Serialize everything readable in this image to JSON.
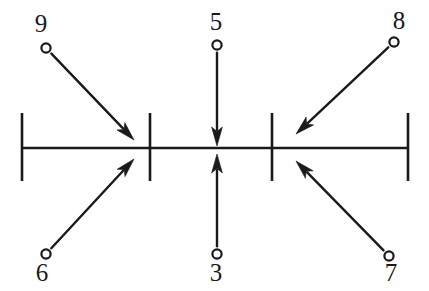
{
  "figure": {
    "background_color": "#ffffff",
    "ink_color": "#1a1a1a",
    "width": 429,
    "height": 291
  },
  "axis": {
    "name": "horizontal-number-line",
    "y": 148,
    "x_start": 22,
    "x_end": 408,
    "stroke_width": 2.6,
    "ticks": [
      {
        "id": "tick-left-end",
        "x": 22,
        "y_top": 113,
        "y_bottom": 181
      },
      {
        "id": "tick-second",
        "x": 150,
        "y_top": 113,
        "y_bottom": 181
      },
      {
        "id": "tick-third",
        "x": 272,
        "y_top": 113,
        "y_bottom": 181
      },
      {
        "id": "tick-right-end",
        "x": 408,
        "y_top": 113,
        "y_bottom": 181
      }
    ]
  },
  "arrows": [
    {
      "id": "arrow-9",
      "label": "9",
      "side": "above",
      "direction": "down-right",
      "label_x": 41,
      "label_y": 32,
      "origin_x": 46,
      "origin_y": 48,
      "tip_x": 134,
      "tip_y": 140,
      "dot_r": 4.6
    },
    {
      "id": "arrow-5",
      "label": "5",
      "side": "above",
      "direction": "down",
      "label_x": 216,
      "label_y": 30,
      "origin_x": 217,
      "origin_y": 45,
      "tip_x": 217,
      "tip_y": 146,
      "dot_r": 4.6
    },
    {
      "id": "arrow-8",
      "label": "8",
      "side": "above",
      "direction": "down-left",
      "label_x": 399,
      "label_y": 29,
      "origin_x": 394,
      "origin_y": 42,
      "tip_x": 296,
      "tip_y": 134,
      "dot_r": 4.6
    },
    {
      "id": "arrow-6",
      "label": "6",
      "side": "below",
      "direction": "up-right",
      "label_x": 42,
      "label_y": 281,
      "origin_x": 46,
      "origin_y": 254,
      "tip_x": 134,
      "tip_y": 159,
      "dot_r": 4.6
    },
    {
      "id": "arrow-3",
      "label": "3",
      "side": "below",
      "direction": "up",
      "label_x": 216,
      "label_y": 281,
      "origin_x": 217,
      "origin_y": 254,
      "tip_x": 217,
      "tip_y": 154,
      "dot_r": 4.6
    },
    {
      "id": "arrow-7",
      "label": "7",
      "side": "below",
      "direction": "up-left",
      "label_x": 391,
      "label_y": 281,
      "origin_x": 389,
      "origin_y": 256,
      "tip_x": 296,
      "tip_y": 161,
      "dot_r": 4.6
    }
  ],
  "labels_above": [
    "9",
    "5",
    "8"
  ],
  "labels_below": [
    "6",
    "3",
    "7"
  ]
}
